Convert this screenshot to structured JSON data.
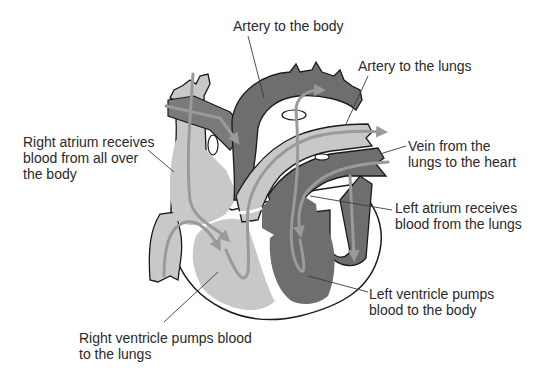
{
  "colors": {
    "background": "#ffffff",
    "deoxygenated_light": "#c8c8c8",
    "oxygenated_dark": "#6e6e6e",
    "flow_arrow": "#9a9a9a",
    "outline": "#1a1a1a",
    "leader_line": "#3a3a3a",
    "text": "#2a2a2a"
  },
  "labels": {
    "artery_body": "Artery to the body",
    "artery_lungs": "Artery to the lungs",
    "vein_lungs": "Vein from the\nlungs to the heart",
    "right_atrium": "Right atrium receives\nblood from all over\nthe body",
    "left_atrium": "Left atrium receives\nblood from the lungs",
    "left_ventricle": "Left ventricle pumps\nblood to the body",
    "right_ventricle": "Right ventricle pumps blood\nto the lungs"
  }
}
